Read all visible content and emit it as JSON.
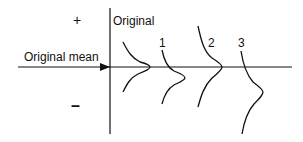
{
  "diagram": {
    "plus_sign": "+",
    "minus_sign": "–",
    "mean_label": "Original mean",
    "curves": [
      {
        "label": "Original"
      },
      {
        "label": "1"
      },
      {
        "label": "2"
      },
      {
        "label": "3"
      }
    ],
    "colors": {
      "line": "#111111",
      "background": "#ffffff"
    }
  }
}
